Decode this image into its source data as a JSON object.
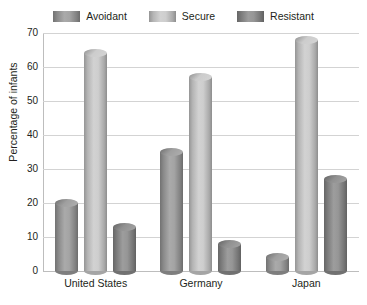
{
  "chart_data": {
    "type": "bar",
    "title": "",
    "subtitle": "",
    "xlabel": "",
    "ylabel": "Percentage of infants",
    "ylim": [
      0,
      70
    ],
    "ytick_step": 10,
    "yticks": [
      "70",
      "60",
      "50",
      "40",
      "30",
      "20",
      "10",
      "0"
    ],
    "grid": true,
    "legend_position": "top-center",
    "categories": [
      "United States",
      "Germany",
      "Japan"
    ],
    "series": [
      {
        "name": "Avoidant",
        "values": [
          20,
          35,
          4
        ],
        "color": "#9a9a9a"
      },
      {
        "name": "Secure",
        "values": [
          64,
          57,
          68
        ],
        "color": "#c9c9c9"
      },
      {
        "name": "Resistant",
        "values": [
          13,
          8,
          27
        ],
        "color": "#8a8a8a"
      }
    ]
  },
  "legend": {
    "items": [
      {
        "label": "Avoidant"
      },
      {
        "label": "Secure"
      },
      {
        "label": "Resistant"
      }
    ]
  },
  "axes": {
    "y_title": "Percentage of infants"
  },
  "colors": {
    "background": "#ffffff",
    "gridline": "#d3d3d3",
    "axis": "#bdbdbd",
    "text": "#231f20"
  }
}
